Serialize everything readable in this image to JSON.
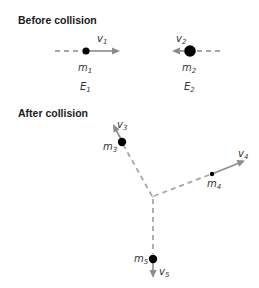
{
  "sections": {
    "before": {
      "title": "Before collision",
      "particles": [
        {
          "mass_label": "m",
          "mass_sub": "1",
          "velocity_label": "v",
          "velocity_sub": "1",
          "energy_label": "E",
          "energy_sub": "1",
          "direction": "right",
          "size": "small"
        },
        {
          "mass_label": "m",
          "mass_sub": "2",
          "velocity_label": "v",
          "velocity_sub": "2",
          "energy_label": "E",
          "energy_sub": "2",
          "direction": "left",
          "size": "large"
        }
      ]
    },
    "after": {
      "title": "After collision",
      "particles": [
        {
          "mass_label": "m",
          "mass_sub": "3",
          "velocity_label": "v",
          "velocity_sub": "3",
          "direction": "up-left",
          "size": "medium"
        },
        {
          "mass_label": "m",
          "mass_sub": "4",
          "velocity_label": "v",
          "velocity_sub": "4",
          "direction": "up-right",
          "size": "tiny"
        },
        {
          "mass_label": "m",
          "mass_sub": "5",
          "velocity_label": "v",
          "velocity_sub": "5",
          "direction": "down",
          "size": "medium"
        }
      ]
    }
  },
  "colors": {
    "ball": "#000000",
    "arrow": "#8c8c8c",
    "dash": "#a6a6a6",
    "label": "#333333",
    "title": "#1a1a1a"
  }
}
